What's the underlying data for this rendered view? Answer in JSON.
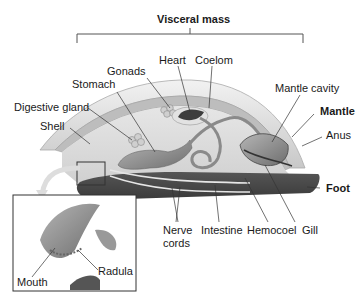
{
  "diagram": {
    "title": "Visceral mass",
    "labels": {
      "visceral_mass": "Visceral mass",
      "heart": "Heart",
      "coelom": "Coelom",
      "gonads": "Gonads",
      "stomach": "Stomach",
      "mantle_cavity": "Mantle cavity",
      "digestive_gland": "Digestive gland",
      "mantle": "Mantle",
      "shell": "Shell",
      "anus": "Anus",
      "foot": "Foot",
      "nerve_cords": "Nerve cords",
      "nerve_line1": "Nerve",
      "nerve_line2": "cords",
      "intestine": "Intestine",
      "hemocoel": "Hemocoel",
      "gill": "Gill",
      "mouth": "Mouth",
      "radula": "Radula"
    },
    "bold_labels": [
      "Visceral mass",
      "Mantle",
      "Foot"
    ]
  }
}
